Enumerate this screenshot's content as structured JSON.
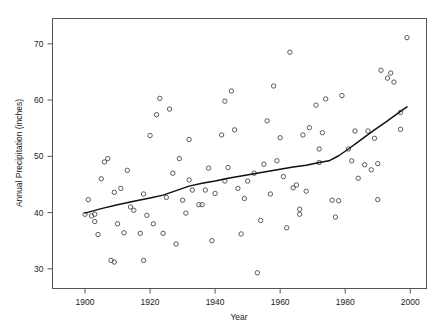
{
  "chart_data": {
    "type": "scatter",
    "title": "",
    "subtitle": "",
    "xlabel": "Year",
    "ylabel": "Annual Precipitation (inches)",
    "xlim": [
      1890,
      2005
    ],
    "ylim": [
      26.5,
      74.5
    ],
    "xticks": [
      1900,
      1920,
      1940,
      1960,
      1980,
      2000
    ],
    "xticklabels": [
      "1900",
      "1920",
      "1940",
      "1960",
      "1980",
      "2000"
    ],
    "yticks": [
      30,
      40,
      50,
      60,
      70
    ],
    "yticklabels": [
      "30",
      "40",
      "50",
      "60",
      "70"
    ],
    "grid": false,
    "legend": null,
    "marker": "open-circle",
    "marker_color": "#4a4a4a",
    "line_color": "#101010",
    "points": [
      {
        "x": 1900,
        "y": 39.7
      },
      {
        "x": 1901,
        "y": 42.3
      },
      {
        "x": 1902,
        "y": 39.4
      },
      {
        "x": 1903,
        "y": 38.4
      },
      {
        "x": 1903,
        "y": 39.7
      },
      {
        "x": 1904,
        "y": 36.1
      },
      {
        "x": 1905,
        "y": 46.0
      },
      {
        "x": 1906,
        "y": 49.0
      },
      {
        "x": 1907,
        "y": 49.6
      },
      {
        "x": 1908,
        "y": 31.5
      },
      {
        "x": 1909,
        "y": 31.2
      },
      {
        "x": 1909,
        "y": 43.6
      },
      {
        "x": 1910,
        "y": 38.0
      },
      {
        "x": 1911,
        "y": 44.3
      },
      {
        "x": 1912,
        "y": 36.4
      },
      {
        "x": 1913,
        "y": 47.5
      },
      {
        "x": 1914,
        "y": 41.0
      },
      {
        "x": 1915,
        "y": 40.4
      },
      {
        "x": 1917,
        "y": 36.3
      },
      {
        "x": 1918,
        "y": 31.5
      },
      {
        "x": 1918,
        "y": 43.3
      },
      {
        "x": 1919,
        "y": 39.5
      },
      {
        "x": 1920,
        "y": 53.7
      },
      {
        "x": 1921,
        "y": 38.0
      },
      {
        "x": 1922,
        "y": 57.4
      },
      {
        "x": 1923,
        "y": 60.3
      },
      {
        "x": 1924,
        "y": 36.3
      },
      {
        "x": 1925,
        "y": 42.7
      },
      {
        "x": 1926,
        "y": 58.4
      },
      {
        "x": 1927,
        "y": 47.0
      },
      {
        "x": 1928,
        "y": 34.4
      },
      {
        "x": 1929,
        "y": 49.6
      },
      {
        "x": 1930,
        "y": 42.2
      },
      {
        "x": 1931,
        "y": 39.9
      },
      {
        "x": 1932,
        "y": 45.8
      },
      {
        "x": 1932,
        "y": 53.0
      },
      {
        "x": 1933,
        "y": 44.0
      },
      {
        "x": 1935,
        "y": 41.4
      },
      {
        "x": 1936,
        "y": 41.4
      },
      {
        "x": 1937,
        "y": 44.0
      },
      {
        "x": 1938,
        "y": 47.9
      },
      {
        "x": 1939,
        "y": 35.0
      },
      {
        "x": 1940,
        "y": 43.4
      },
      {
        "x": 1942,
        "y": 53.8
      },
      {
        "x": 1943,
        "y": 45.6
      },
      {
        "x": 1943,
        "y": 59.8
      },
      {
        "x": 1944,
        "y": 48.0
      },
      {
        "x": 1945,
        "y": 61.6
      },
      {
        "x": 1946,
        "y": 54.7
      },
      {
        "x": 1947,
        "y": 44.3
      },
      {
        "x": 1948,
        "y": 36.2
      },
      {
        "x": 1949,
        "y": 42.5
      },
      {
        "x": 1950,
        "y": 45.6
      },
      {
        "x": 1952,
        "y": 47.0
      },
      {
        "x": 1953,
        "y": 29.3
      },
      {
        "x": 1954,
        "y": 38.6
      },
      {
        "x": 1955,
        "y": 48.6
      },
      {
        "x": 1956,
        "y": 56.3
      },
      {
        "x": 1957,
        "y": 43.3
      },
      {
        "x": 1958,
        "y": 62.5
      },
      {
        "x": 1959,
        "y": 49.2
      },
      {
        "x": 1960,
        "y": 53.3
      },
      {
        "x": 1961,
        "y": 46.4
      },
      {
        "x": 1962,
        "y": 37.3
      },
      {
        "x": 1963,
        "y": 68.5
      },
      {
        "x": 1964,
        "y": 44.4
      },
      {
        "x": 1965,
        "y": 44.9
      },
      {
        "x": 1966,
        "y": 40.6
      },
      {
        "x": 1966,
        "y": 39.7
      },
      {
        "x": 1967,
        "y": 53.8
      },
      {
        "x": 1968,
        "y": 43.8
      },
      {
        "x": 1969,
        "y": 55.1
      },
      {
        "x": 1971,
        "y": 59.1
      },
      {
        "x": 1972,
        "y": 48.9
      },
      {
        "x": 1972,
        "y": 51.3
      },
      {
        "x": 1973,
        "y": 54.2
      },
      {
        "x": 1974,
        "y": 60.2
      },
      {
        "x": 1976,
        "y": 42.2
      },
      {
        "x": 1977,
        "y": 39.2
      },
      {
        "x": 1978,
        "y": 42.1
      },
      {
        "x": 1979,
        "y": 60.8
      },
      {
        "x": 1981,
        "y": 51.3
      },
      {
        "x": 1982,
        "y": 49.2
      },
      {
        "x": 1983,
        "y": 54.5
      },
      {
        "x": 1984,
        "y": 46.1
      },
      {
        "x": 1986,
        "y": 48.5
      },
      {
        "x": 1987,
        "y": 54.5
      },
      {
        "x": 1988,
        "y": 47.6
      },
      {
        "x": 1989,
        "y": 53.2
      },
      {
        "x": 1990,
        "y": 42.3
      },
      {
        "x": 1990,
        "y": 48.7
      },
      {
        "x": 1991,
        "y": 65.3
      },
      {
        "x": 1993,
        "y": 63.9
      },
      {
        "x": 1994,
        "y": 64.8
      },
      {
        "x": 1995,
        "y": 63.2
      },
      {
        "x": 1997,
        "y": 54.8
      },
      {
        "x": 1997,
        "y": 57.8
      },
      {
        "x": 1999,
        "y": 71.1
      }
    ],
    "trend_line": {
      "name": "lowess-smooth",
      "points": [
        {
          "x": 1900,
          "y": 39.9
        },
        {
          "x": 1905,
          "y": 40.7
        },
        {
          "x": 1910,
          "y": 41.4
        },
        {
          "x": 1915,
          "y": 42.0
        },
        {
          "x": 1920,
          "y": 42.6
        },
        {
          "x": 1924,
          "y": 43.1
        },
        {
          "x": 1928,
          "y": 43.9
        },
        {
          "x": 1932,
          "y": 44.7
        },
        {
          "x": 1936,
          "y": 45.2
        },
        {
          "x": 1940,
          "y": 45.6
        },
        {
          "x": 1944,
          "y": 46.1
        },
        {
          "x": 1948,
          "y": 46.5
        },
        {
          "x": 1952,
          "y": 46.9
        },
        {
          "x": 1956,
          "y": 47.3
        },
        {
          "x": 1960,
          "y": 47.7
        },
        {
          "x": 1964,
          "y": 48.1
        },
        {
          "x": 1968,
          "y": 48.4
        },
        {
          "x": 1972,
          "y": 48.9
        },
        {
          "x": 1975,
          "y": 49.2
        },
        {
          "x": 1978,
          "y": 50.1
        },
        {
          "x": 1981,
          "y": 51.3
        },
        {
          "x": 1985,
          "y": 53.0
        },
        {
          "x": 1989,
          "y": 54.7
        },
        {
          "x": 1993,
          "y": 56.3
        },
        {
          "x": 1997,
          "y": 58.0
        },
        {
          "x": 1999,
          "y": 58.8
        }
      ]
    }
  }
}
